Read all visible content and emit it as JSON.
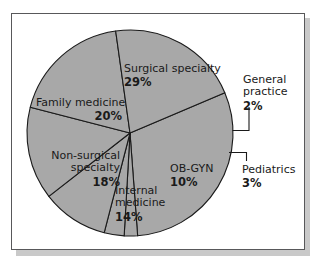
{
  "figure": {
    "background_color": "#ffffff",
    "panel_border_color": "#58585a",
    "shadow_color": "#c9c9c9"
  },
  "chart_data": {
    "type": "pie",
    "title": "",
    "subtitle": "",
    "xlabel": "",
    "ylabel": "",
    "grid": false,
    "legend_position": "none",
    "label_format": "name + percent",
    "units": "percent",
    "total": 96,
    "slice_fill_color": "#a8a8a8",
    "slice_outline_color": "#1a1a1a",
    "start_angle_deg": -23,
    "direction": "clockwise",
    "categories": [
      "Surgical specialty",
      "General practice",
      "Pediatrics",
      "OB-GYN",
      "Internal medicine",
      "Non-surgical specialty",
      "Family medicine"
    ],
    "values": [
      29,
      2,
      3,
      10,
      14,
      18,
      20
    ],
    "slices": [
      {
        "label": "Surgical specialty",
        "percent_text": "29%",
        "value": 29,
        "label_placement": "inside",
        "label_align": "left",
        "label_lines": [
          "Surgical specialty"
        ]
      },
      {
        "label": "General practice",
        "percent_text": "2%",
        "value": 2,
        "label_placement": "outside",
        "label_align": "left",
        "label_lines": [
          "General",
          "practice"
        ]
      },
      {
        "label": "Pediatrics",
        "percent_text": "3%",
        "value": 3,
        "label_placement": "outside",
        "label_align": "left",
        "label_lines": [
          "Pediatrics"
        ]
      },
      {
        "label": "OB-GYN",
        "percent_text": "10%",
        "value": 10,
        "label_placement": "inside",
        "label_align": "left",
        "label_lines": [
          "OB-GYN"
        ]
      },
      {
        "label": "Internal medicine",
        "percent_text": "14%",
        "value": 14,
        "label_placement": "inside",
        "label_align": "left",
        "label_lines": [
          "Internal",
          "medicine"
        ]
      },
      {
        "label": "Non-surgical specialty",
        "percent_text": "18%",
        "value": 18,
        "label_placement": "inside",
        "label_align": "right",
        "label_lines": [
          "Non-surgical",
          "specialty"
        ]
      },
      {
        "label": "Family medicine",
        "percent_text": "20%",
        "value": 20,
        "label_placement": "inside",
        "label_align": "right",
        "label_lines": [
          "Family medicine"
        ]
      }
    ]
  },
  "labels": {
    "surgical": {
      "line1": "Surgical specialty",
      "pct": "29%"
    },
    "family": {
      "line1": "Family medicine",
      "pct": "20%"
    },
    "nonsurgical": {
      "line1": "Non-surgical",
      "line2": "specialty",
      "pct": "18%"
    },
    "internal": {
      "line1": "Internal",
      "line2": "medicine",
      "pct": "14%"
    },
    "obgyn": {
      "line1": "OB-GYN",
      "pct": "10%"
    },
    "general": {
      "line1": "General",
      "line2": "practice",
      "pct": "2%"
    },
    "pediatrics": {
      "line1": "Pediatrics",
      "pct": "3%"
    }
  }
}
